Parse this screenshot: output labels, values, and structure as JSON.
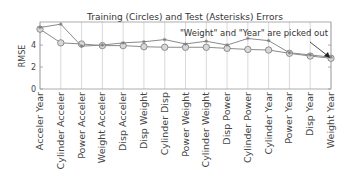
{
  "chart_data": {
    "type": "line",
    "title": "Training (Circles) and Test (Asterisks) Errors",
    "xlabel": "",
    "ylabel": "RMSE",
    "ylim": [
      0,
      6.1
    ],
    "yticks": [
      0,
      2,
      4
    ],
    "grid": "vertical",
    "annotation": "\"Weight\" and \"Year\" are picked out",
    "categories": [
      "Acceler Year",
      "Cylinder Acceler",
      "Power Acceler",
      "Weight Acceler",
      "Disp Acceler",
      "Disp Weight",
      "Cylinder Disp",
      "Power Weight",
      "Cylinder Weight",
      "Disp Power",
      "Cylinder Power",
      "Cylinder Year",
      "Power Year",
      "Disp Year",
      "Weight Year"
    ],
    "series": [
      {
        "name": "Training (Circles)",
        "marker": "circle",
        "values": [
          5.45,
          4.2,
          4.1,
          3.95,
          3.95,
          3.85,
          3.8,
          3.8,
          3.8,
          3.7,
          3.6,
          3.55,
          3.25,
          3.0,
          2.8
        ]
      },
      {
        "name": "Test (Asterisks)",
        "marker": "asterisk",
        "values": [
          5.6,
          5.9,
          3.9,
          4.0,
          4.2,
          4.3,
          4.5,
          4.1,
          4.35,
          4.0,
          4.6,
          4.4,
          3.3,
          3.1,
          2.9
        ]
      }
    ],
    "colors": {
      "line": "#8a8a8a",
      "grid": "#c8c8c8",
      "axis": "#9a9a9a",
      "marker_fill": "#d8d8d8"
    }
  }
}
